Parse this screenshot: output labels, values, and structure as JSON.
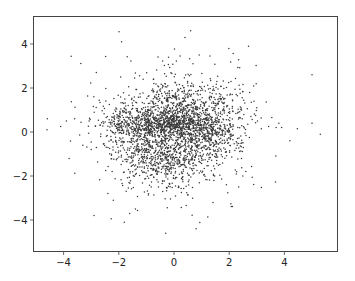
{
  "chart_data": {
    "type": "scatter",
    "title": "",
    "xlabel": "",
    "ylabel": "",
    "xlim": [
      -5.0,
      6.0
    ],
    "ylim": [
      -5.3,
      5.3
    ],
    "xticks": [
      -4,
      -2,
      0,
      2,
      4
    ],
    "xtick_labels": [
      "−4",
      "−2",
      "0",
      "2",
      "4"
    ],
    "yticks": [
      -4,
      -2,
      0,
      2,
      4
    ],
    "ytick_labels": [
      "−4",
      "−2",
      "0",
      "2",
      "4"
    ],
    "grid": false,
    "legend": null,
    "marker": {
      "size": 1.2,
      "color": "#3a3a3a"
    },
    "approx_point_count": 3000,
    "clusters": [
      {
        "name": "central band",
        "cx": -0.1,
        "cy": 0.35,
        "sx": 0.75,
        "sy": 0.35,
        "n": 700
      },
      {
        "name": "left lobe",
        "cx": -1.7,
        "cy": 0.25,
        "sx": 0.6,
        "sy": 0.55,
        "n": 300
      },
      {
        "name": "upper center",
        "cx": 0.0,
        "cy": 1.2,
        "sx": 0.7,
        "sy": 0.7,
        "n": 350
      },
      {
        "name": "upper right",
        "cx": 1.5,
        "cy": 0.9,
        "sx": 0.6,
        "sy": 0.6,
        "n": 220
      },
      {
        "name": "lower blob",
        "cx": -0.3,
        "cy": -1.2,
        "sx": 0.9,
        "sy": 0.65,
        "n": 600
      },
      {
        "name": "lower right arm",
        "cx": 1.3,
        "cy": -0.3,
        "sx": 0.55,
        "sy": 0.45,
        "n": 220
      },
      {
        "name": "halo",
        "cx": 0.0,
        "cy": 0.0,
        "sx": 1.5,
        "sy": 1.5,
        "n": 550
      }
    ],
    "outliers": [
      [
        -4.6,
        0.1
      ],
      [
        -3.9,
        0.5
      ],
      [
        -3.6,
        0.6
      ],
      [
        -3.3,
        -0.6
      ],
      [
        -3.0,
        -0.8
      ],
      [
        -3.8,
        -1.2
      ],
      [
        -2.9,
        -3.8
      ],
      [
        -2.2,
        -3.1
      ],
      [
        -1.8,
        -4.1
      ],
      [
        -1.4,
        -3.5
      ],
      [
        -0.3,
        -4.6
      ],
      [
        0.8,
        -4.4
      ],
      [
        -1.9,
        4.1
      ],
      [
        -0.2,
        3.4
      ],
      [
        0.4,
        4.3
      ],
      [
        0.6,
        4.6
      ],
      [
        2.7,
        3.9
      ],
      [
        2.9,
        1.4
      ],
      [
        3.0,
        1.1
      ],
      [
        5.0,
        2.6
      ],
      [
        3.8,
        0.4
      ],
      [
        3.9,
        0.2
      ],
      [
        4.2,
        -0.4
      ],
      [
        5.0,
        0.4
      ],
      [
        5.3,
        -0.1
      ],
      [
        2.3,
        -0.3
      ],
      [
        1.9,
        -2.4
      ],
      [
        2.6,
        -1.8
      ]
    ],
    "seed": 7
  },
  "axes": {
    "frame_color": "#444444",
    "background": "#ffffff"
  }
}
